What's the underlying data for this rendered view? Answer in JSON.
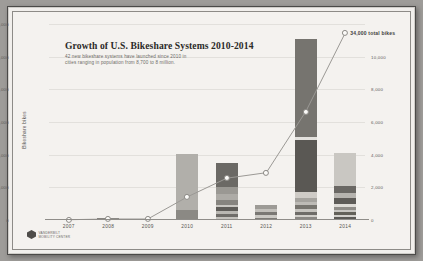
{
  "header": {
    "title": "Growth of U.S. Bikeshare Systems 2010-2014",
    "subtitle_line1": "42 new bikeshare systems have launched since 2010 in",
    "subtitle_line2": "cities ranging in population from 8,700 to 8 million."
  },
  "annotation": {
    "total_label": "34,000 total bikes"
  },
  "logo": {
    "line1": "VANDERBILT",
    "line2": "MOBILITY CENTER"
  },
  "chart_data": {
    "type": "bar",
    "title": "Growth of U.S. Bikeshare Systems 2010-2014",
    "xlabel": "",
    "ylabel": "Bikeshare bikes",
    "ylim": [
      0,
      12000
    ],
    "grid": true,
    "legend": "none",
    "categories": [
      "2007",
      "2008",
      "2009",
      "2010",
      "2011",
      "2012",
      "2013",
      "2014"
    ],
    "yticks_left": [
      "12,000",
      "10,000",
      "8,000",
      "6,000",
      "4,000",
      "2,000",
      "0"
    ],
    "yticks_left_values": [
      12000,
      10000,
      8000,
      6000,
      4000,
      2000,
      0
    ],
    "yticks_right": [
      "10,000",
      "8,000",
      "6,000",
      "4,000",
      "2,000",
      "0"
    ],
    "yticks_right_values": [
      10000,
      8000,
      6000,
      4000,
      2000,
      0
    ],
    "bar_totals": [
      60,
      120,
      0,
      4050,
      3480,
      900,
      11100,
      4100
    ],
    "stacks": [
      {
        "year": "2007",
        "segments": [
          {
            "value": 60,
            "color": "#8e8c88"
          }
        ]
      },
      {
        "year": "2008",
        "segments": [
          {
            "value": 120,
            "color": "#7d7b77"
          }
        ]
      },
      {
        "year": "2009",
        "segments": []
      },
      {
        "year": "2010",
        "segments": [
          {
            "value": 600,
            "color": "#8b8984"
          },
          {
            "value": 3450,
            "color": "#b1afaa"
          }
        ]
      },
      {
        "year": "2011",
        "segments": [
          {
            "value": 180,
            "color": "#c4c2bd"
          },
          {
            "value": 200,
            "color": "#6f6d69"
          },
          {
            "value": 170,
            "color": "#b9b7b2"
          },
          {
            "value": 220,
            "color": "#5f5d59"
          },
          {
            "value": 180,
            "color": "#c9c7c2"
          },
          {
            "value": 300,
            "color": "#86847f"
          },
          {
            "value": 330,
            "color": "#adaba6"
          },
          {
            "value": 420,
            "color": "#9a9893"
          },
          {
            "value": 1480,
            "color": "#6b6965"
          }
        ]
      },
      {
        "year": "2012",
        "segments": [
          {
            "value": 150,
            "color": "#7e7c78"
          },
          {
            "value": 160,
            "color": "#cbc9c4"
          },
          {
            "value": 190,
            "color": "#7a7874"
          },
          {
            "value": 180,
            "color": "#c2c0bb"
          },
          {
            "value": 220,
            "color": "#9d9b96"
          }
        ]
      },
      {
        "year": "2013",
        "segments": [
          {
            "value": 170,
            "color": "#8a8884"
          },
          {
            "value": 150,
            "color": "#d0cec9"
          },
          {
            "value": 200,
            "color": "#6e6c68"
          },
          {
            "value": 160,
            "color": "#c6c4bf"
          },
          {
            "value": 230,
            "color": "#77756f"
          },
          {
            "value": 180,
            "color": "#bdbbb6"
          },
          {
            "value": 260,
            "color": "#a5a39e"
          },
          {
            "value": 350,
            "color": "#cecbc6"
          },
          {
            "value": 3200,
            "color": "#5a5854"
          },
          {
            "value": 160,
            "color": "#e3e1dd"
          },
          {
            "value": 6040,
            "color": "#76746f"
          }
        ]
      },
      {
        "year": "2014",
        "segments": [
          {
            "value": 160,
            "color": "#5c5a56"
          },
          {
            "value": 130,
            "color": "#d3d1cc"
          },
          {
            "value": 200,
            "color": "#636159"
          },
          {
            "value": 150,
            "color": "#c8c6c1"
          },
          {
            "value": 180,
            "color": "#8f8d88"
          },
          {
            "value": 140,
            "color": "#dedcd7"
          },
          {
            "value": 420,
            "color": "#5e5c58"
          },
          {
            "value": 260,
            "color": "#b6b4af"
          },
          {
            "value": 460,
            "color": "#6a6864"
          },
          {
            "value": 2000,
            "color": "#c9c7c2"
          }
        ]
      }
    ],
    "cumulative_series": {
      "name": "Total bikes",
      "x": [
        "2007",
        "2008",
        "2009",
        "2010",
        "2011",
        "2012",
        "2013",
        "2014"
      ],
      "values": [
        60,
        180,
        180,
        4200,
        7600,
        8600,
        19700,
        34000
      ],
      "plot_scale_max": 34000
    }
  }
}
